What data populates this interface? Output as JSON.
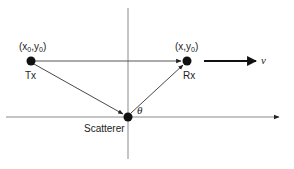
{
  "diagram": {
    "type": "bistatic scattering geometry",
    "colors": {
      "axis": "#8a8a8a",
      "ray": "#333333",
      "node": "#111111",
      "velocity_arrow": "#111111",
      "text": "#222222"
    },
    "nodes": {
      "tx": {
        "label": "Tx",
        "coord_label_pre": "(x",
        "coord_label_sub0": "0",
        "coord_label_mid": ",y",
        "coord_label_sub1": "0",
        "coord_label_post": ")"
      },
      "rx": {
        "label": "Rx",
        "coord_label_pre": "(x,y",
        "coord_label_sub": "0",
        "coord_label_post": ")"
      },
      "scatterer": {
        "label": "Scatterer"
      }
    },
    "angle_label": "θ",
    "velocity_label": "v",
    "edges": [
      {
        "from": "tx",
        "to": "rx",
        "arrow": true
      },
      {
        "from": "tx",
        "to": "scatterer",
        "arrow": true
      },
      {
        "from": "scatterer",
        "to": "rx",
        "arrow": true
      }
    ],
    "axes": {
      "horizontal": {
        "arrow": "right"
      },
      "vertical": {
        "arrow": "none"
      }
    }
  }
}
